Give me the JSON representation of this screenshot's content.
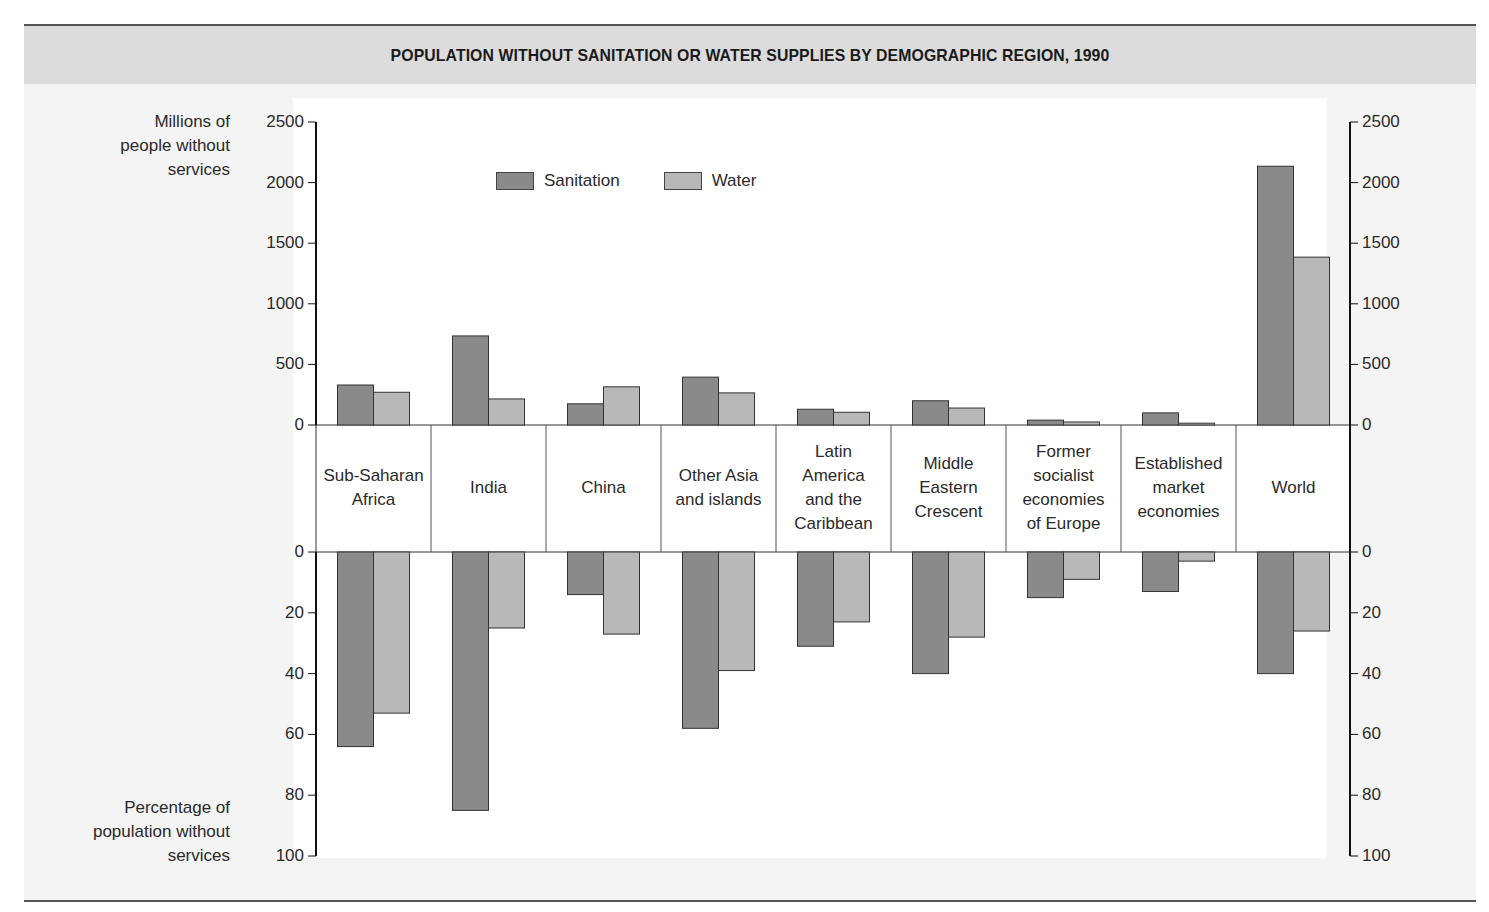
{
  "title": "POPULATION WITHOUT SANITATION OR WATER SUPPLIES BY DEMOGRAPHIC REGION, 1990",
  "labels": {
    "top_axis_lines": [
      "Millions of",
      "people without",
      "services"
    ],
    "bottom_axis_lines": [
      "Percentage of",
      "population without",
      "services"
    ]
  },
  "legend": [
    {
      "label": "Sanitation",
      "color": "#8a8a8a"
    },
    {
      "label": "Water",
      "color": "#b8b8b8"
    }
  ],
  "colors": {
    "sanitation": "#8a8a8a",
    "water": "#b8b8b8",
    "axis": "#222222",
    "title_band": "#dcdcdc"
  },
  "regions": [
    {
      "name": "Sub-Saharan Africa",
      "lines": [
        "Sub-Saharan",
        "Africa"
      ]
    },
    {
      "name": "India",
      "lines": [
        "India"
      ]
    },
    {
      "name": "China",
      "lines": [
        "China"
      ]
    },
    {
      "name": "Other Asia and islands",
      "lines": [
        "Other Asia",
        "and islands"
      ]
    },
    {
      "name": "Latin America and the Caribbean",
      "lines": [
        "Latin",
        "America",
        "and the",
        "Caribbean"
      ]
    },
    {
      "name": "Middle Eastern Crescent",
      "lines": [
        "Middle",
        "Eastern",
        "Crescent"
      ]
    },
    {
      "name": "Former socialist economies of Europe",
      "lines": [
        "Former",
        "socialist",
        "economies",
        "of Europe"
      ]
    },
    {
      "name": "Established market economies",
      "lines": [
        "Established",
        "market",
        "economies"
      ]
    },
    {
      "name": "World",
      "lines": [
        "World"
      ]
    }
  ],
  "chart_data": [
    {
      "type": "bar",
      "title": "POPULATION WITHOUT SANITATION OR WATER SUPPLIES BY DEMOGRAPHIC REGION, 1990",
      "panel": "top",
      "ylabel": "Millions of people without services",
      "ylim": [
        0,
        2500
      ],
      "yticks": [
        0,
        500,
        1000,
        1500,
        2000,
        2500
      ],
      "categories": [
        "Sub-Saharan Africa",
        "India",
        "China",
        "Other Asia and islands",
        "Latin America and the Caribbean",
        "Middle Eastern Crescent",
        "Former socialist economies of Europe",
        "Established market economies",
        "World"
      ],
      "series": [
        {
          "name": "Sanitation",
          "values": [
            330,
            735,
            175,
            395,
            130,
            200,
            40,
            100,
            2135
          ]
        },
        {
          "name": "Water",
          "values": [
            270,
            215,
            315,
            265,
            105,
            140,
            25,
            15,
            1385
          ]
        }
      ],
      "legend_position": "top-left inside plot",
      "grid": false
    },
    {
      "type": "bar",
      "panel": "bottom (inverted)",
      "ylabel": "Percentage of population without services",
      "ylim": [
        0,
        100
      ],
      "yticks": [
        0,
        20,
        40,
        60,
        80,
        100
      ],
      "categories": [
        "Sub-Saharan Africa",
        "India",
        "China",
        "Other Asia and islands",
        "Latin America and the Caribbean",
        "Middle Eastern Crescent",
        "Former socialist economies of Europe",
        "Established market economies",
        "World"
      ],
      "series": [
        {
          "name": "Sanitation",
          "values": [
            64,
            85,
            14,
            58,
            31,
            40,
            15,
            13,
            40
          ]
        },
        {
          "name": "Water",
          "values": [
            53,
            25,
            27,
            39,
            23,
            28,
            9,
            3,
            26
          ]
        }
      ],
      "grid": false
    }
  ]
}
